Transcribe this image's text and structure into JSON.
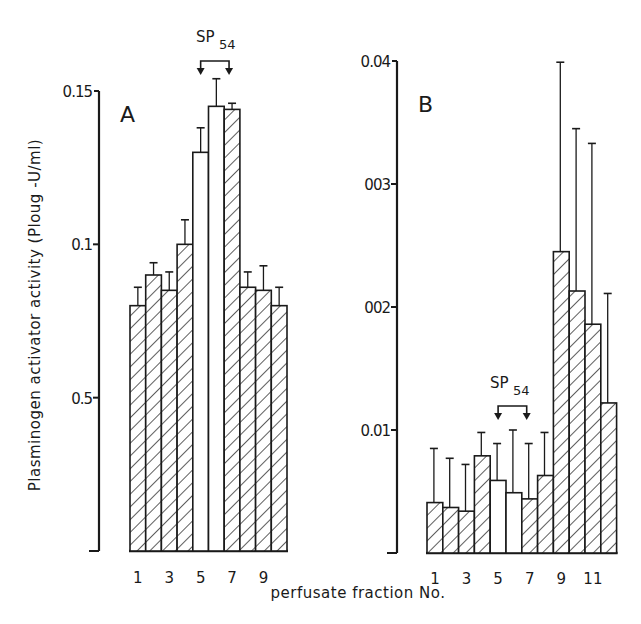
{
  "chart_data": [
    {
      "type": "bar",
      "panel": "A",
      "categories": [
        "1",
        "2",
        "3",
        "4",
        "5",
        "6",
        "7",
        "8",
        "9",
        "10"
      ],
      "category_tick_labels": [
        "1",
        "3",
        "5",
        "7",
        "9"
      ],
      "values": [
        0.08,
        0.09,
        0.085,
        0.1,
        0.13,
        0.145,
        0.144,
        0.086,
        0.085,
        0.08
      ],
      "error_upper": [
        0.086,
        0.094,
        0.091,
        0.108,
        0.138,
        0.154,
        0.146,
        0.091,
        0.093,
        0.086
      ],
      "fill": [
        "hatched",
        "hatched",
        "hatched",
        "hatched",
        "open",
        "open",
        "hatched",
        "hatched",
        "hatched",
        "hatched"
      ],
      "ylim": [
        0,
        0.15
      ],
      "yticks": [
        0,
        0.05,
        0.1,
        0.15
      ],
      "ytick_labels": [
        "",
        "0.5",
        "0.1",
        "0.15"
      ],
      "annotation": {
        "text": "SP",
        "subscript": "54",
        "from_bar": 5,
        "to_bar": 7,
        "note": "bracket arrows over fractions 5 and 7"
      }
    },
    {
      "type": "bar",
      "panel": "B",
      "categories": [
        "1",
        "2",
        "3",
        "4",
        "5",
        "6",
        "7",
        "8",
        "9",
        "10",
        "11",
        "12"
      ],
      "category_tick_labels": [
        "1",
        "3",
        "5",
        "7",
        "9",
        "11"
      ],
      "values": [
        0.00041,
        0.00037,
        0.00034,
        0.00079,
        0.00059,
        0.00049,
        0.00044,
        0.00063,
        0.00245,
        0.00213,
        0.00186,
        0.00122
      ],
      "error_upper": [
        0.00085,
        0.00077,
        0.00072,
        0.00098,
        0.00089,
        0.001,
        0.00089,
        0.00098,
        0.00399,
        0.00345,
        0.00333,
        0.00211
      ],
      "fill": [
        "hatched",
        "hatched",
        "hatched",
        "hatched",
        "open",
        "open",
        "hatched",
        "hatched",
        "hatched",
        "hatched",
        "hatched",
        "hatched"
      ],
      "ylim": [
        0,
        0.004
      ],
      "yticks": [
        0,
        0.001,
        0.002,
        0.003,
        0.004
      ],
      "ytick_labels": [
        "",
        "0.01",
        "002",
        "003",
        "0.04"
      ],
      "annotation": {
        "text": "SP",
        "subscript": "54",
        "from_bar": 5,
        "to_bar": 7,
        "note": "bracket arrows over fractions 5 and 7"
      }
    }
  ],
  "labels": {
    "ylabel": "Plasminogen activator activity (Ploug -U/ml)",
    "xlabel": "perfusate fraction No.",
    "panel_a": "A",
    "panel_b": "B"
  },
  "colors": {
    "ink": "#1a1a1a",
    "background": "#ffffff"
  }
}
